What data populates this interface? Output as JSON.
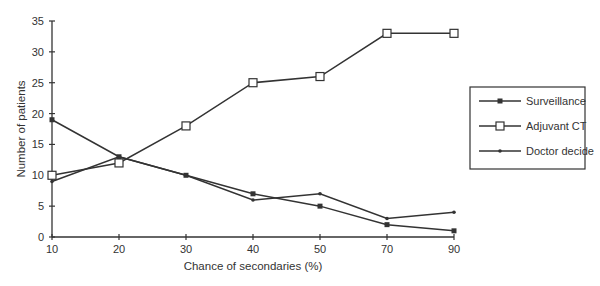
{
  "chart_data": {
    "type": "line",
    "title": "",
    "xlabel": "Chance of secondaries (%)",
    "ylabel": "Number of patients",
    "categories": [
      "10",
      "20",
      "30",
      "40",
      "50",
      "70",
      "90"
    ],
    "ylim": [
      0,
      35
    ],
    "yticks": [
      0,
      5,
      10,
      15,
      20,
      25,
      30,
      35
    ],
    "grid": false,
    "legend_position": "right",
    "series": [
      {
        "name": "Surveillance",
        "marker": "filled-square",
        "values": [
          19,
          13,
          10,
          7,
          5,
          2,
          1
        ]
      },
      {
        "name": "Adjuvant CT",
        "marker": "open-square",
        "values": [
          10,
          12,
          18,
          25,
          26,
          33,
          33
        ]
      },
      {
        "name": "Doctor decide",
        "marker": "dot",
        "values": [
          9,
          13,
          10,
          6,
          7,
          3,
          4
        ]
      }
    ]
  },
  "colors": {
    "line": "#333333",
    "background": "#ffffff"
  }
}
